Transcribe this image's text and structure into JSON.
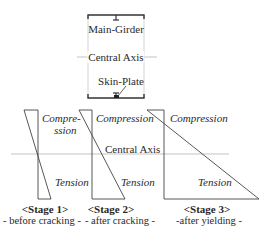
{
  "cross_section": {
    "main_girder_label": "Main-Girder",
    "central_axis_label": "Central Axis",
    "skin_plate_label": "Skin-Plate"
  },
  "stress_diagrams": {
    "central_axis_label": "Central Axis",
    "stages": [
      {
        "title": "<Stage 1>",
        "subtitle": "- before cracking -",
        "compression_line1": "Compre-",
        "compression_line2": "ssion",
        "tension": "Tension"
      },
      {
        "title": "<Stage 2>",
        "subtitle": "- after cracking -",
        "compression": "Compression",
        "tension": "Tension"
      },
      {
        "title": "<Stage 3>",
        "subtitle": "-after yielding -",
        "compression": "Compression",
        "tension": "Tension"
      }
    ]
  },
  "colors": {
    "line": "#333333",
    "axis": "#aaaaaa",
    "box": "#bbbbbb"
  }
}
